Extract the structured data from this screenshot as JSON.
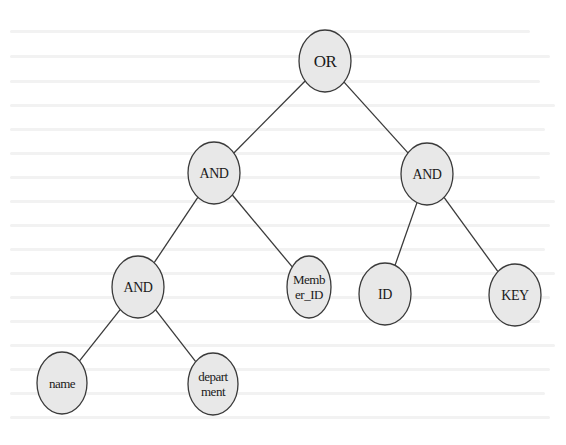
{
  "diagram": {
    "type": "tree",
    "colors": {
      "node_fill": "#e8e8e8",
      "node_stroke": "#3a3a3a",
      "edge": "#3a3a3a",
      "text": "#1a1a1a",
      "background": "#ffffff"
    },
    "nodes": [
      {
        "id": "or",
        "lines": [
          "OR"
        ],
        "cx": 325,
        "cy": 61,
        "rx": 26,
        "ry": 31,
        "font_size": 17
      },
      {
        "id": "and-left",
        "lines": [
          "AND"
        ],
        "cx": 214,
        "cy": 173,
        "rx": 26,
        "ry": 31,
        "font_size": 14
      },
      {
        "id": "and-right",
        "lines": [
          "AND"
        ],
        "cx": 427,
        "cy": 174,
        "rx": 26,
        "ry": 31,
        "font_size": 14
      },
      {
        "id": "and-bottom",
        "lines": [
          "AND"
        ],
        "cx": 138,
        "cy": 287,
        "rx": 26,
        "ry": 31,
        "font_size": 14
      },
      {
        "id": "member-id",
        "lines": [
          "Memb",
          "er_ID"
        ],
        "cx": 309,
        "cy": 287,
        "rx": 22,
        "ry": 31,
        "font_size": 13
      },
      {
        "id": "id",
        "lines": [
          "ID"
        ],
        "cx": 385,
        "cy": 294,
        "rx": 26,
        "ry": 31,
        "font_size": 14
      },
      {
        "id": "key",
        "lines": [
          "KEY"
        ],
        "cx": 515,
        "cy": 295,
        "rx": 26,
        "ry": 31,
        "font_size": 14
      },
      {
        "id": "name",
        "lines": [
          "name"
        ],
        "cx": 62,
        "cy": 383,
        "rx": 25,
        "ry": 31,
        "font_size": 13
      },
      {
        "id": "department",
        "lines": [
          "depart",
          "ment"
        ],
        "cx": 213,
        "cy": 384,
        "rx": 25,
        "ry": 31,
        "font_size": 13
      }
    ],
    "edges": [
      {
        "from": "or",
        "to": "and-left"
      },
      {
        "from": "or",
        "to": "and-right"
      },
      {
        "from": "and-left",
        "to": "and-bottom"
      },
      {
        "from": "and-left",
        "to": "member-id"
      },
      {
        "from": "and-right",
        "to": "id"
      },
      {
        "from": "and-right",
        "to": "key"
      },
      {
        "from": "and-bottom",
        "to": "name"
      },
      {
        "from": "and-bottom",
        "to": "department"
      }
    ]
  }
}
